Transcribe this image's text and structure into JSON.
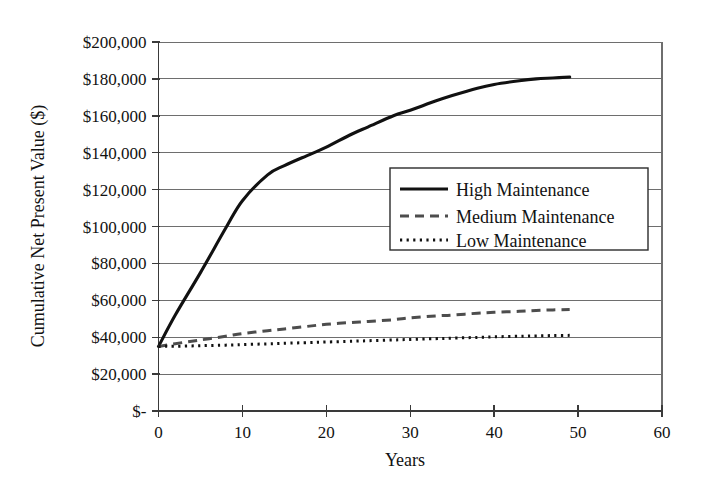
{
  "chart_data": {
    "type": "line",
    "title": "",
    "xlabel": "Years",
    "ylabel": "Cumulative Net Present Value ($)",
    "xlim": [
      0,
      60
    ],
    "ylim": [
      0,
      200000
    ],
    "grid": true,
    "legend_position": "center-right",
    "xticks": [
      0,
      10,
      20,
      30,
      40,
      50,
      60
    ],
    "xtick_labels": [
      "0",
      "10",
      "20",
      "30",
      "40",
      "50",
      "60"
    ],
    "yticks": [
      0,
      20000,
      40000,
      60000,
      80000,
      100000,
      120000,
      140000,
      160000,
      180000,
      200000
    ],
    "ytick_labels": [
      "$-",
      "$20,000",
      "$40,000",
      "$60,000",
      "$80,000",
      "$100,000",
      "$120,000",
      "$140,000",
      "$160,000",
      "$180,000",
      "$200,000"
    ],
    "x": [
      0,
      2,
      5,
      8,
      10,
      13,
      15,
      18,
      20,
      23,
      25,
      28,
      30,
      33,
      35,
      38,
      40,
      43,
      45,
      47,
      49
    ],
    "series": [
      {
        "name": "High Maintenance",
        "style": "solid",
        "color": "#111111",
        "values": [
          35000,
          52000,
          75000,
          99000,
          114000,
          128000,
          133000,
          139000,
          143000,
          150000,
          154000,
          160000,
          163000,
          168000,
          171000,
          175000,
          177000,
          179000,
          180000,
          180500,
          181000
        ]
      },
      {
        "name": "Medium Maintenance",
        "style": "dashed",
        "color": "#4d4d4d",
        "values": [
          35000,
          36500,
          38500,
          40500,
          42000,
          43500,
          44500,
          46000,
          47000,
          48000,
          48500,
          49500,
          50500,
          51500,
          52000,
          53000,
          53500,
          54000,
          54500,
          54800,
          55000
        ]
      },
      {
        "name": "Low Maintenance",
        "style": "dotted",
        "color": "#111111",
        "values": [
          35000,
          35100,
          35400,
          35700,
          36000,
          36400,
          36700,
          37100,
          37400,
          37800,
          38100,
          38500,
          38800,
          39200,
          39500,
          39900,
          40200,
          40500,
          40700,
          40900,
          41000
        ]
      }
    ]
  },
  "legend": {
    "items": [
      {
        "label": "High Maintenance"
      },
      {
        "label": "Medium Maintenance"
      },
      {
        "label": "Low Maintenance"
      }
    ]
  },
  "axes": {
    "x_title": "Years",
    "y_title": "Cumulative Net Present Value ($)"
  }
}
